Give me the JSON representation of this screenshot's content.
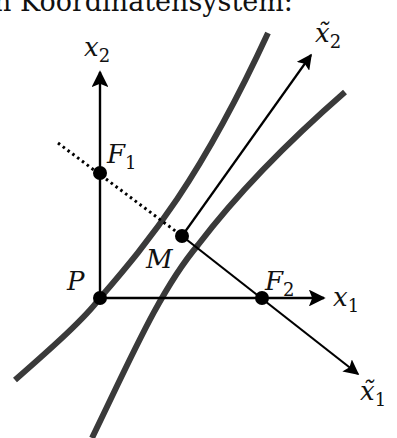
{
  "caption": "n Koordinatensystem:",
  "labels": {
    "x2": "x",
    "x2_sub": "2",
    "x1": "x",
    "x1_sub": "1",
    "x2_tilde": "x̃",
    "x2_tilde_sub": "2",
    "x1_tilde": "x̃",
    "x1_tilde_sub": "1",
    "F1": "F",
    "F1_sub": "1",
    "F2": "F",
    "F2_sub": "2",
    "P": "P",
    "M": "M"
  },
  "colors": {
    "curve": "#3a3a3a",
    "axis": "#000000",
    "point": "#000000"
  },
  "points": {
    "P": [
      100,
      298
    ],
    "F1": [
      100,
      173
    ],
    "F2": [
      262,
      298
    ],
    "M": [
      182,
      236
    ]
  }
}
